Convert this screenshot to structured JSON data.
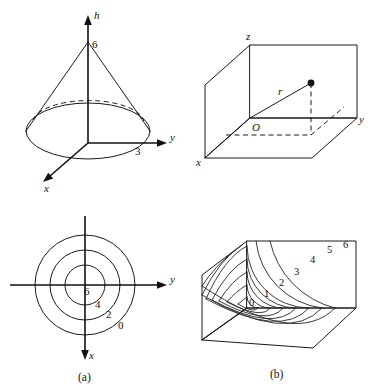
{
  "figure": {
    "caption_a": "(a)",
    "caption_b": "(b)",
    "panels": {
      "cone": {
        "name": "cone-3d",
        "axis_h": "h",
        "axis_y": "y",
        "axis_x": "x",
        "apex_value": "6",
        "radius_value": "3"
      },
      "box": {
        "name": "box-3d",
        "axis_z": "z",
        "axis_y": "y",
        "axis_x": "x",
        "origin": "O",
        "radius_label": "r"
      },
      "contour_circles": {
        "name": "contour-circles",
        "axis_y": "y",
        "axis_x": "x",
        "levels": [
          "6",
          "4",
          "2",
          "0"
        ]
      },
      "contour_surface": {
        "name": "contour-surface",
        "levels": [
          "0",
          "1",
          "2",
          "3",
          "4",
          "5",
          "6"
        ]
      }
    }
  },
  "colors": {
    "ink": "#1a1a1a",
    "background": "#ffffff"
  }
}
